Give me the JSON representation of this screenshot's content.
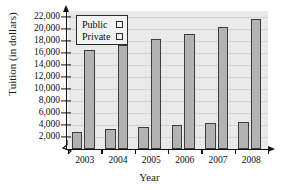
{
  "chart_data": {
    "type": "bar",
    "title": "",
    "xlabel": "Year",
    "ylabel": "Tuition (in dollars)",
    "categories": [
      "2003",
      "2004",
      "2005",
      "2006",
      "2007",
      "2008"
    ],
    "series": [
      {
        "name": "Public",
        "values": [
          2900,
          3400,
          3700,
          4000,
          4300,
          4500
        ],
        "color": "#b3b3b3"
      },
      {
        "name": "Private",
        "values": [
          16500,
          17400,
          18300,
          19100,
          20300,
          21700
        ],
        "color": "#b3b3b3"
      }
    ],
    "ylim": [
      0,
      23000
    ],
    "y_ticks": [
      2000,
      4000,
      6000,
      8000,
      10000,
      12000,
      14000,
      16000,
      18000,
      20000,
      22000
    ],
    "y_tick_labels": [
      "2,000",
      "4,000",
      "6,000",
      "8,000",
      "10,000",
      "12,000",
      "14,000",
      "16,000",
      "18,000",
      "20,000",
      "22,000"
    ],
    "grid": true,
    "y_axis_break": true,
    "legend_position": "top-left",
    "legend_entries": [
      "Public",
      "Private"
    ],
    "plot_background": "#e9e9e9",
    "bar_border_color": "#3d3d3d",
    "axis_color": "#111111"
  }
}
